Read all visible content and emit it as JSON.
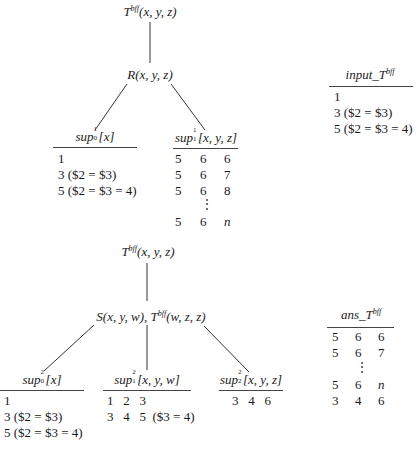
{
  "tree1": {
    "root": {
      "pred": "T",
      "adorn": "bff",
      "args": "(x, y, z)"
    },
    "child": {
      "pred": "R",
      "args": "(x, y, z)"
    },
    "sup0": {
      "name": "sup",
      "sup": "1",
      "sub": "0",
      "args": "[x]",
      "rows": [
        "1",
        "3  ($2 = $3)",
        "5  ($2 = $3 = 4)"
      ]
    },
    "sup1": {
      "name": "sup",
      "sup": "1",
      "sub": "1",
      "args": "[x, y, z]",
      "rows": [
        [
          "5",
          "6",
          "6"
        ],
        [
          "5",
          "6",
          "7"
        ],
        [
          "5",
          "6",
          "8"
        ],
        [
          "",
          "⋮",
          ""
        ],
        [
          "5",
          "6",
          "n"
        ]
      ]
    }
  },
  "input_table": {
    "name": "input_T",
    "adorn": "bff",
    "rows": [
      "1",
      "3  ($2 = $3)",
      "5  ($2 = $3 = 4)"
    ]
  },
  "tree2": {
    "root": {
      "pred": "T",
      "adorn": "bff",
      "args": "(x, y, z)"
    },
    "child": {
      "pred1": "S",
      "args1": "(x, y, w), ",
      "pred2": "T",
      "adorn2": "bff",
      "args2": "(w, z, z)"
    },
    "sup0": {
      "name": "sup",
      "sup": "2",
      "sub": "0",
      "args": "[x]",
      "rows": [
        "1",
        "3  ($2 = $3)",
        "5  ($2 = $3 = 4)"
      ]
    },
    "sup1": {
      "name": "sup",
      "sup": "2",
      "sub": "1",
      "args": "[x, y, w]",
      "rows": [
        "1   2   3",
        "3   4   5  ($3 = 4)"
      ]
    },
    "sup2": {
      "name": "sup",
      "sup": "2",
      "sub": "2",
      "args": "[x, y, z]",
      "rows": [
        "3   4   6"
      ]
    }
  },
  "ans_table": {
    "name": "ans_T",
    "adorn": "bff",
    "rows": [
      [
        "5",
        "6",
        "6"
      ],
      [
        "5",
        "6",
        "7"
      ],
      [
        "",
        "⋮",
        ""
      ],
      [
        "5",
        "6",
        "n"
      ],
      [
        "3",
        "4",
        "6"
      ]
    ]
  }
}
